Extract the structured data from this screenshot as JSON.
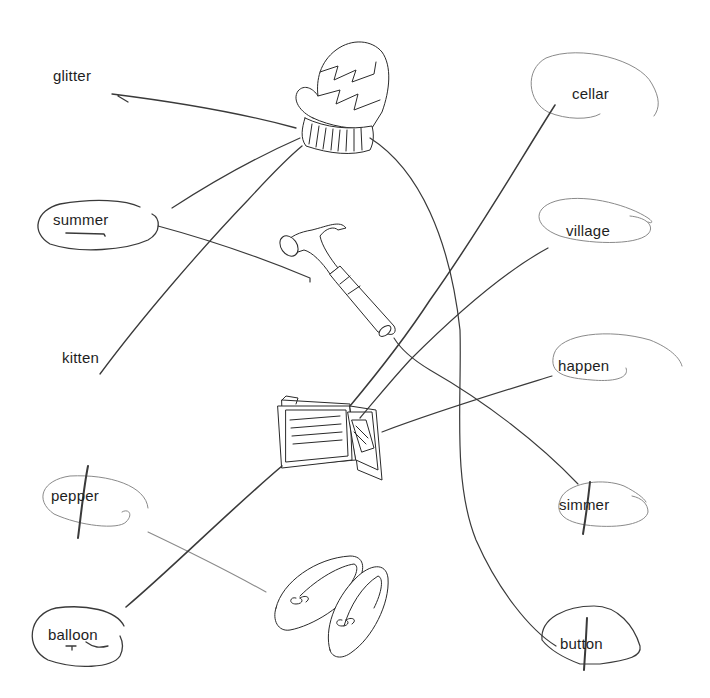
{
  "worksheet": {
    "left_words": [
      {
        "id": "glitter",
        "label": "glitter",
        "x": 53,
        "y": 75,
        "circled": false,
        "crossed": false,
        "underlined": false
      },
      {
        "id": "summer",
        "label": "summer",
        "x": 53,
        "y": 213,
        "circled": true,
        "crossed": false,
        "underlined": true
      },
      {
        "id": "kitten",
        "label": "kitten",
        "x": 62,
        "y": 350,
        "circled": false,
        "crossed": false,
        "underlined": false
      },
      {
        "id": "pepper",
        "label": "pepper",
        "x": 51,
        "y": 489,
        "circled": true,
        "crossed": true,
        "underlined": false
      },
      {
        "id": "balloon",
        "label": "balloon",
        "x": 48,
        "y": 628,
        "circled": true,
        "crossed": false,
        "underlined": true
      }
    ],
    "right_words": [
      {
        "id": "cellar",
        "label": "cellar",
        "x": 572,
        "y": 86,
        "circled": true,
        "crossed": false,
        "underlined": false
      },
      {
        "id": "village",
        "label": "village",
        "x": 566,
        "y": 223,
        "circled": true,
        "crossed": false,
        "underlined": false
      },
      {
        "id": "happen",
        "label": "happen",
        "x": 558,
        "y": 358,
        "circled": true,
        "crossed": false,
        "underlined": false
      },
      {
        "id": "simmer",
        "label": "simmer",
        "x": 559,
        "y": 497,
        "circled": true,
        "crossed": true,
        "underlined": false
      },
      {
        "id": "button",
        "label": "button",
        "x": 560,
        "y": 636,
        "circled": true,
        "crossed": true,
        "underlined": false
      }
    ],
    "pictures": [
      {
        "id": "mitten",
        "label": "mitten"
      },
      {
        "id": "hammer",
        "label": "hammer"
      },
      {
        "id": "wallet",
        "label": "wallet"
      },
      {
        "id": "slippers",
        "label": "slippers"
      }
    ],
    "matches": [
      {
        "from": "glitter",
        "to": "mitten"
      },
      {
        "from": "summer",
        "to": "mitten"
      },
      {
        "from": "summer",
        "to": "hammer"
      },
      {
        "from": "kitten",
        "to": "mitten"
      },
      {
        "from": "pepper",
        "to": "slippers"
      },
      {
        "from": "balloon",
        "to": "wallet"
      },
      {
        "from": "cellar",
        "to": "wallet"
      },
      {
        "from": "village",
        "to": "wallet"
      },
      {
        "from": "happen",
        "to": "wallet"
      },
      {
        "from": "simmer",
        "to": "hammer"
      },
      {
        "from": "button",
        "to": "mitten"
      }
    ],
    "colors": {
      "paper": "#ffffff",
      "ink": "#1e1e1e",
      "pencil": "#3a3a3a"
    }
  }
}
